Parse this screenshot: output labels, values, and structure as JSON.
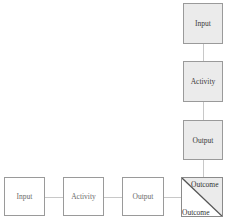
{
  "diagram": {
    "colors": {
      "shaded_fill": "#ebebeb",
      "plain_fill": "#ffffff",
      "border": "#9a9a9a",
      "connector": "#c8c8c8",
      "diagonal": "#555555"
    },
    "vertical_chain": [
      {
        "label": "Input",
        "style": "shaded"
      },
      {
        "label": "Activity",
        "style": "shaded"
      },
      {
        "label": "Output",
        "style": "shaded"
      }
    ],
    "horizontal_chain": [
      {
        "label": "Input",
        "style": "plain"
      },
      {
        "label": "Activity",
        "style": "plain"
      },
      {
        "label": "Output",
        "style": "plain"
      }
    ],
    "outcome": {
      "top_right_label": "Outcome",
      "bottom_left_label": "Outcome",
      "style": "split-diagonal"
    }
  }
}
